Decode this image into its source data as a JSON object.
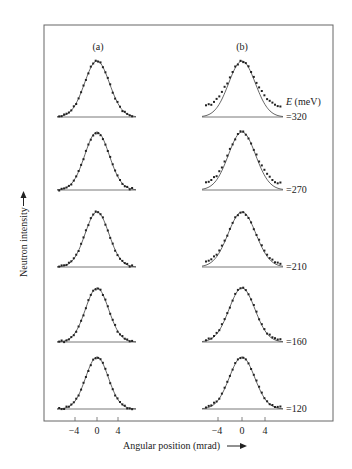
{
  "chart_data": {
    "type": "line",
    "title": "",
    "panels": [
      {
        "label": "(a)",
        "description": "Gaussian fit (solid line) with measured points; fits the data well at all energies"
      },
      {
        "label": "(b)",
        "description": "Gaussian fit (solid line) with measured points; wings elevated above the fit at higher energies"
      }
    ],
    "xlabel": "Angular position (mrad)",
    "ylabel": "Neutron intensity",
    "x_ticks": [
      -4,
      0,
      4
    ],
    "xlim": [
      -7.5,
      7.5
    ],
    "energy_label": "E (meV)",
    "series": [
      {
        "name": "E = 320 meV",
        "energy_label": "=320",
        "sigma_a": 2.3,
        "sigma_b": 2.25,
        "wing_excess_b": 0.18
      },
      {
        "name": "E = 270 meV",
        "energy_label": "=270",
        "sigma_a": 2.25,
        "sigma_b": 2.3,
        "wing_excess_b": 0.1
      },
      {
        "name": "E = 210 meV",
        "energy_label": "=210",
        "sigma_a": 2.2,
        "sigma_b": 2.35,
        "wing_excess_b": 0.05
      },
      {
        "name": "E = 160 meV",
        "energy_label": "=160",
        "sigma_a": 2.15,
        "sigma_b": 2.2,
        "wing_excess_b": 0.02
      },
      {
        "name": "E = 120 meV",
        "energy_label": "=120",
        "sigma_a": 2.1,
        "sigma_b": 2.15,
        "wing_excess_b": 0.02
      }
    ],
    "grid": false,
    "legend": "energy labels at right of each row"
  },
  "labels": {
    "panel_a": "(a)",
    "panel_b": "(b)",
    "energy_header_italic": "E",
    "energy_header_unit": " (meV)",
    "x_axis": "Angular position (mrad)",
    "y_axis": "Neutron intensity",
    "tick_neg4": "−4",
    "tick_0": "0",
    "tick_4": "4",
    "e320": "=320",
    "e270": "=270",
    "e210": "=210",
    "e160": "=160",
    "e120": "=120"
  },
  "colors": {
    "line": "#555555",
    "points": "#222222",
    "frame": "#666666"
  }
}
